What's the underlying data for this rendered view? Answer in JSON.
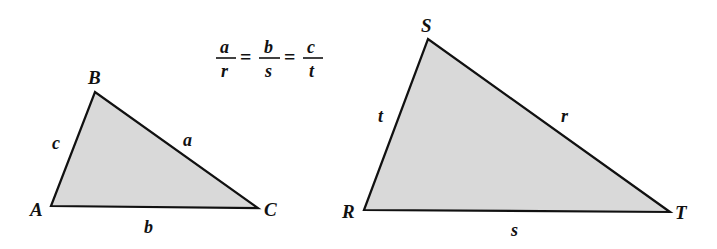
{
  "figure": {
    "fill_color": "#d9d9d9",
    "stroke_color": "#111111"
  },
  "triangle_abc": {
    "vertices": {
      "A": "A",
      "B": "B",
      "C": "C"
    },
    "sides": {
      "a": "a",
      "b": "b",
      "c": "c"
    }
  },
  "triangle_rst": {
    "vertices": {
      "R": "R",
      "S": "S",
      "T": "T"
    },
    "sides": {
      "r": "r",
      "s": "s",
      "t": "t"
    }
  },
  "formula": {
    "f1_num": "a",
    "f1_den": "r",
    "f2_num": "b",
    "f2_den": "s",
    "f3_num": "c",
    "f3_den": "t",
    "equals": "="
  }
}
